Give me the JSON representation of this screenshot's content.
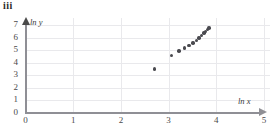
{
  "figure": {
    "part_label": "iii",
    "background_color": "#ffffff",
    "grid_color": "#e9e9ec",
    "axis_color": "#8f8f95",
    "point_color": "#4a4a4f"
  },
  "chart_data": {
    "type": "scatter",
    "title": "iii",
    "xlabel": "ln x",
    "ylabel": "ln y",
    "xlim": [
      0,
      5
    ],
    "ylim": [
      0,
      7
    ],
    "xticks": [
      0,
      1,
      2,
      3,
      4,
      5
    ],
    "yticks": [
      0,
      1,
      2,
      3,
      4,
      5,
      6,
      7
    ],
    "xtick_labels": [
      "0",
      "1",
      "2",
      "3",
      "4",
      "5"
    ],
    "ytick_labels": [
      "0",
      "1",
      "2",
      "3",
      "4",
      "5",
      "6",
      "7"
    ],
    "grid": true,
    "legend": "none",
    "series": [
      {
        "name": "ln y vs ln x",
        "x": [
          2.71,
          3.06,
          3.22,
          3.33,
          3.43,
          3.51,
          3.58,
          3.64,
          3.69,
          3.74,
          3.78,
          3.81,
          3.85
        ],
        "y": [
          3.47,
          4.58,
          4.92,
          5.15,
          5.35,
          5.55,
          5.75,
          5.95,
          6.15,
          6.35,
          6.5,
          6.62,
          6.75
        ]
      }
    ]
  }
}
